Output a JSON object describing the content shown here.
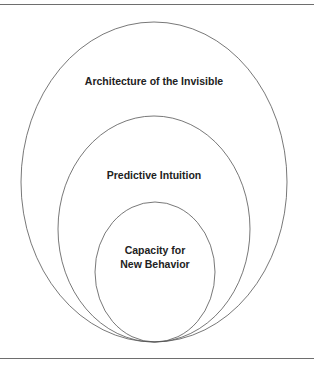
{
  "diagram": {
    "type": "nested-ellipses",
    "stroke_color": "#555555",
    "layers": [
      {
        "label": "Architecture of the Invisible",
        "lines": [
          "Architecture of the Invisible"
        ]
      },
      {
        "label": "Predictive Intuition",
        "lines": [
          "Predictive Intuition"
        ]
      },
      {
        "label": "Capacity for New Behavior",
        "lines": [
          "Capacity for",
          "New Behavior"
        ]
      }
    ]
  }
}
